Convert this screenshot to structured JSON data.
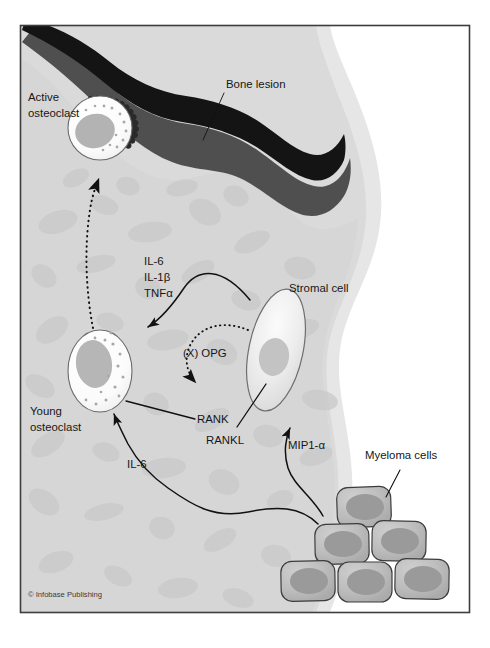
{
  "figure": {
    "credit": "© Infobase Publishing",
    "frame_color": "#3d3d3d",
    "background_color": "#ffffff"
  },
  "palette": {
    "marrow_fill": "#d6d6d6",
    "marrow_mottle": "#c9c9c9",
    "cortical_outer": "#e4e4e4",
    "cortical_inner": "#dcdcdc",
    "lesion_dark": "#141414",
    "lesion_mid": "#4f4f4f",
    "cell_white": "#fdfdfd",
    "cell_outline": "#5a5a5a",
    "nucleus_gray": "#b0b0b0",
    "stromal_fill": "#ececec",
    "stromal_outline": "#6e6e6e",
    "stromal_nucleus": "#c2c2c2",
    "myeloma_fill": "#bdbdbd",
    "myeloma_nucleus": "#9a9a9a",
    "myeloma_outline": "#3c3c3c",
    "arrow_color": "#111111",
    "text_color": "#161616"
  },
  "labels": {
    "bone_lesion": "Bone lesion",
    "active_osteoclast_line1": "Active",
    "active_osteoclast_line2": "osteoclast",
    "young_osteoclast_line1": "Young",
    "young_osteoclast_line2": "osteoclast",
    "stromal_cell": "Stromal cell",
    "myeloma_cells": "Myeloma cells",
    "rank": "RANK",
    "rankl": "RANKL",
    "opg": "(X) OPG",
    "mip1a": "MIP1-α",
    "il6_bottom": "IL-6"
  },
  "cytokines": {
    "items": [
      "IL-6",
      "IL-1β",
      "TNFα"
    ]
  },
  "structures": [
    {
      "name": "cortical-bone",
      "description": "Cortical bone shell, light gray"
    },
    {
      "name": "bone-marrow",
      "description": "Mottled gray marrow cavity"
    },
    {
      "name": "bone-lesion",
      "description": "Dark lytic lesion eroding bone surface"
    },
    {
      "name": "active-osteoclast",
      "description": "Osteoclast with ruffled border resorbing bone"
    },
    {
      "name": "young-osteoclast",
      "description": "Immature osteoclast precursor in marrow"
    },
    {
      "name": "stromal-cell",
      "description": "Elongated bone marrow stromal cell"
    },
    {
      "name": "myeloma-cell-cluster",
      "description": "Pyramid cluster of six myeloma cells"
    }
  ],
  "arrows": [
    {
      "name": "maturation-arrow",
      "style": "dotted",
      "from": "young-osteoclast",
      "to": "active-osteoclast"
    },
    {
      "name": "cytokine-arrow",
      "style": "solid",
      "from": "stromal-cell",
      "to": "young-osteoclast",
      "label": "IL-6 / IL-1β / TNFα"
    },
    {
      "name": "opg-arrow",
      "style": "dotted",
      "from": "stromal-cell",
      "to": "rank",
      "label": "(X) OPG"
    },
    {
      "name": "rank-pointer",
      "style": "solid-line",
      "from": "rank-label",
      "to": "young-osteoclast"
    },
    {
      "name": "rankl-pointer",
      "style": "solid-line",
      "from": "rankl-label",
      "to": "stromal-cell"
    },
    {
      "name": "mip1a-arrow",
      "style": "solid",
      "from": "myeloma-cell-cluster",
      "to": "stromal-cell",
      "label": "MIP1-α"
    },
    {
      "name": "il6-arrow",
      "style": "solid",
      "from": "myeloma-cell-cluster",
      "to": "young-osteoclast",
      "label": "IL-6"
    },
    {
      "name": "bone-lesion-leader",
      "style": "leader-line",
      "from": "bone-lesion-label",
      "to": "bone-lesion"
    },
    {
      "name": "myeloma-cells-leader",
      "style": "leader-line",
      "from": "myeloma-cells-label",
      "to": "myeloma-cell-cluster"
    }
  ]
}
